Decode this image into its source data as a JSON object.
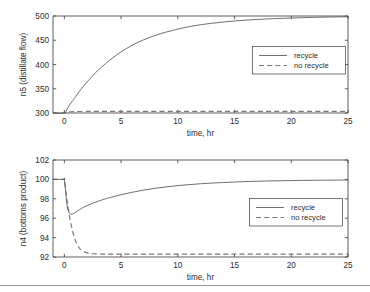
{
  "figure": {
    "background": "#ffffff",
    "line_color": "#555555",
    "dashed_color": "#777777",
    "axis_color": "#4d4d4d",
    "footer_rule_color": "#9a9a9a"
  },
  "chart_data": [
    {
      "type": "line",
      "panel": "top",
      "title": "",
      "xlabel": "time, hr",
      "ylabel": "n5 (distillate flow)",
      "xlim": [
        -1,
        25
      ],
      "ylim": [
        300,
        500
      ],
      "xticks": [
        0,
        5,
        10,
        15,
        20,
        25
      ],
      "xticklabels": [
        "0",
        "5",
        "10",
        "15",
        "20",
        "25"
      ],
      "yticks": [
        300,
        350,
        400,
        450,
        500
      ],
      "yticklabels": [
        "300",
        "350",
        "400",
        "450",
        "500"
      ],
      "grid": false,
      "legend_position": "right-upper",
      "legend": [
        "recycle",
        "no recycle"
      ],
      "series": [
        {
          "name": "recycle",
          "style": "solid",
          "x": [
            -1,
            0,
            0.25,
            0.5,
            0.75,
            1,
            1.5,
            2,
            2.5,
            3,
            3.5,
            4,
            5,
            6,
            7,
            8,
            9,
            10,
            11,
            12,
            13,
            14,
            15,
            16,
            17,
            18,
            19,
            20,
            21,
            22,
            23,
            24,
            25
          ],
          "y": [
            300,
            300,
            309,
            318,
            326,
            334,
            350,
            364,
            377,
            389,
            399,
            409,
            426,
            440,
            451,
            460,
            467,
            473,
            478,
            482,
            485,
            487.5,
            489.8,
            491.5,
            492.9,
            494.1,
            495.1,
            495.9,
            496.6,
            497.2,
            497.7,
            498.1,
            498.5
          ]
        },
        {
          "name": "no recycle",
          "style": "dashed",
          "x": [
            -1,
            0,
            0.5,
            1,
            2,
            3,
            5,
            10,
            15,
            20,
            25
          ],
          "y": [
            300,
            300,
            302.4,
            303,
            303.2,
            303.2,
            303.2,
            303.2,
            303.2,
            303.2,
            303.2
          ]
        }
      ]
    },
    {
      "type": "line",
      "panel": "bottom",
      "title": "",
      "xlabel": "time, hr",
      "ylabel": "n4 (bottoms product)",
      "xlim": [
        -1,
        25
      ],
      "ylim": [
        92,
        102
      ],
      "xticks": [
        0,
        5,
        10,
        15,
        20,
        25
      ],
      "xticklabels": [
        "0",
        "5",
        "10",
        "15",
        "20",
        "25"
      ],
      "yticks": [
        92,
        94,
        96,
        98,
        100,
        102
      ],
      "yticklabels": [
        "92",
        "94",
        "96",
        "98",
        "100",
        "102"
      ],
      "grid": false,
      "legend_position": "right-lower",
      "legend": [
        "recycle",
        "no recycle"
      ],
      "series": [
        {
          "name": "recycle",
          "style": "solid",
          "x": [
            -1,
            -0.05,
            0,
            0.1,
            0.2,
            0.3,
            0.4,
            0.5,
            0.6,
            0.7,
            0.8,
            1,
            1.2,
            1.5,
            2,
            2.5,
            3,
            3.5,
            4,
            5,
            6,
            7,
            8,
            9,
            10,
            11,
            12,
            13,
            14,
            15,
            16,
            17,
            18,
            19,
            20,
            21,
            22,
            23,
            24,
            25
          ],
          "y": [
            100,
            100,
            100,
            98.9,
            97.7,
            97.0,
            96.65,
            96.45,
            96.4,
            96.42,
            96.48,
            96.62,
            96.78,
            97.0,
            97.3,
            97.55,
            97.76,
            97.95,
            98.12,
            98.42,
            98.68,
            98.9,
            99.08,
            99.23,
            99.36,
            99.46,
            99.55,
            99.62,
            99.68,
            99.73,
            99.78,
            99.81,
            99.84,
            99.86,
            99.88,
            99.9,
            99.91,
            99.92,
            99.93,
            99.94
          ]
        },
        {
          "name": "no recycle",
          "style": "dashed",
          "x": [
            -1,
            -0.05,
            0,
            0.15,
            0.3,
            0.5,
            0.7,
            0.9,
            1.1,
            1.3,
            1.5,
            1.7,
            2,
            2.3,
            2.6,
            3,
            3.5,
            4,
            5,
            7,
            10,
            15,
            20,
            25
          ],
          "y": [
            100,
            100,
            100,
            98.6,
            97.3,
            95.9,
            94.8,
            93.95,
            93.35,
            92.95,
            92.7,
            92.55,
            92.42,
            92.36,
            92.33,
            92.31,
            92.3,
            92.3,
            92.3,
            92.3,
            92.3,
            92.3,
            92.3,
            92.3
          ]
        }
      ]
    }
  ]
}
